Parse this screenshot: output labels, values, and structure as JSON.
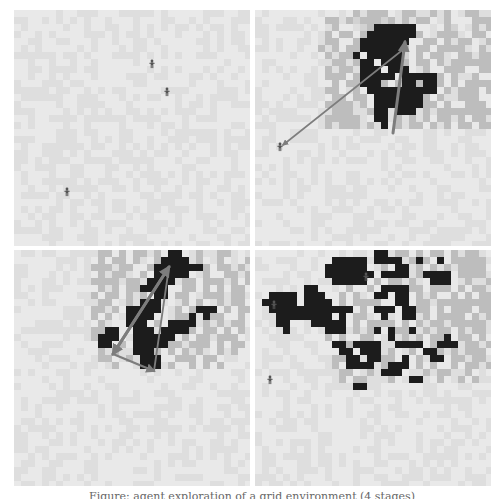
{
  "figure": {
    "caption": "Figure: agent exploration of a grid environment (4 stages)",
    "colors": {
      "light": "#e9e9e9",
      "light_alt": "#dedede",
      "mid": "#bdbdbd",
      "dark": "#1c1c1c",
      "arrow": "#7d7d7d",
      "agent": "#555555"
    },
    "cell_size": 7,
    "grid_size": 34
  },
  "panels": [
    {
      "id": "panel-1",
      "label": "Stage 1: initial positions",
      "x": 14,
      "y": 10,
      "agents": [
        [
          138,
          54
        ],
        [
          153,
          82
        ],
        [
          53,
          182
        ]
      ],
      "arrows": [],
      "rows": []
    },
    {
      "id": "panel-2",
      "label": "Stage 2: exploration begins",
      "x": 255,
      "y": 10,
      "agents": [
        [
          25,
          137
        ]
      ],
      "arrows": [
        {
          "from": [
            150,
            38
          ],
          "to": [
            28,
            135
          ],
          "width": 1.6,
          "head": "end"
        },
        {
          "from": [
            138,
            123
          ],
          "to": [
            150,
            32
          ],
          "width": 3,
          "head": "end"
        }
      ],
      "rows": [
        "..............g.ggg..gg..g.g..gg..",
        "..........gg.g-ggg-g.g.gg..g...ggg",
        "...........g...-g######....g-..g.g",
        "..........g.gg.g#######g..ggg..gg.",
        "..........gg..g#######..gg.g.gg..g",
        ".........g.g.gg######g.gg.gggg..g.",
        "..........g.gg#.#####-.g.gg..gg.gg",
        "...........gg.g##.###g.gg.g.gggggg",
        "..........g.gg.###.###..g..ggg..gg",
        "..........ggg.g#####.#####g.g..g..",
        "...........g.gg###g.g##g##g.g.gggg",
        "..........gg..g.##########.g.ggg.g",
        "...........gg.gg.#######g.g..ggg..",
        "..........gggg.g.#######gg.g..ggg.",
        "...........ggg..g##.###.g.gggggggg",
        "..........ggggg..##.g.g.g.gg.g.gg.",
        "..........g.ggg.g.#.g.gg.g.g.gg.gg"
      ]
    },
    {
      "id": "panel-3",
      "label": "Stage 3: clustering with routes",
      "x": 14,
      "y": 250,
      "agents": [],
      "arrows": [
        {
          "from": [
            99,
            104
          ],
          "to": [
            155,
            17
          ],
          "width": 3,
          "head": "end"
        },
        {
          "from": [
            155,
            17
          ],
          "to": [
            99,
            104
          ],
          "width": 3,
          "head": "end"
        },
        {
          "from": [
            99,
            104
          ],
          "to": [
            140,
            121
          ],
          "width": 2.4,
          "head": "end"
        },
        {
          "from": [
            140,
            121
          ],
          "to": [
            155,
            17
          ],
          "width": 1.8,
          "head": "none"
        }
      ],
      "rows": [
        "............gg.g.gg.g.##..g..gg...",
        "............g.gg.g..g####.g..g...g",
        "...........ggg.gg..g#######g.gg.g.",
        "............g.gg..g.#####..g..gg.g",
        "...........gggg.gg.####.gg.ggg.g.g",
        "............g.g.gg####..gg.g.g.gg.",
        "...........g.gg.g.g.##.gg..ggg.gg.",
        "............gg..g.###...g.g..g.gg.",
        "...........gg.g.#####..g.g###.g.gg",
        "...........g.g..####...gg#.#gg..g.",
        "............g...###.g.####.g.g.gg.",
        "...........gg##..###.####g.gg.g.g.",
        "...........g###..######.g.gg.ggg..",
        "............##.g.#####gg.ggg.g.gg.",
        "............g.g..###g.g.g.g..g.g..",
        "............gg..g.###..ggg.gg.....",
        "..............g...###.g..g.g.g...."
      ]
    },
    {
      "id": "panel-4",
      "label": "Stage 4: merged clusters",
      "x": 255,
      "y": 250,
      "agents": [
        [
          15,
          130
        ],
        [
          19,
          55
        ],
        [
          111,
          27
        ]
      ],
      "arrows": [],
      "rows": [
        ".................##.gg.g.gg.g.gg..",
        "...........#####.####.g#g.#.ggggg.",
        "..........######..g.##.g.g.g.gggg.",
        "..........#######.####.g####.gggg.",
        "...........#####.g.gg.g..###..g..g",
        ".......##....g..g.####gg.ggg.g.gg.",
        "..####.###..g.g..##.##.g.g..g.g.gg",
        ".#####.####.g.gggg..##.gg.gggggggg",
        "..############.g.###.##gg.g.ggg.gg",
        "...########.#.gg..#..##.g.gggg.g.g",
        "...##...#####.g.gggg.g.g.gg.ggggg.",
        "....#.....###.g.g#.#gg#.g.gg.g.gg.",
        "..........g.g..gg..#.g.g.gg#.gg.g.",
        "...........##g####..####.g###.gg.g",
        "............##.###.g..g.##g.g.ggg.",
        "...........gg##.##gg.#.g.##.gg.gg.",
        "...........g.####.g###.g.g..g.gg.g",
        "............gg..g.###...g.gg..g...",
        "............g.gg...g..##..g..g.g..",
        "..............##.................."
      ]
    }
  ]
}
